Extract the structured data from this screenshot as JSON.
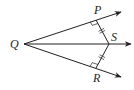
{
  "diagram": {
    "type": "geometry",
    "stroke_color": "#231f20",
    "points": {
      "Q": {
        "label": "Q",
        "x": 24,
        "y": 44
      },
      "P": {
        "label": "P",
        "x": 96,
        "y": 20
      },
      "S": {
        "label": "S",
        "x": 109,
        "y": 44
      },
      "R": {
        "label": "R",
        "x": 96,
        "y": 68
      }
    },
    "rays": [
      {
        "name": "ray-QP",
        "from": "Q",
        "through": "P",
        "end": {
          "x": 121,
          "y": 12
        }
      },
      {
        "name": "ray-QS",
        "from": "Q",
        "through": "S",
        "end": {
          "x": 131,
          "y": 44
        }
      },
      {
        "name": "ray-QR",
        "from": "Q",
        "through": "R",
        "end": {
          "x": 121,
          "y": 77
        }
      }
    ],
    "segments": [
      {
        "name": "segment-PS",
        "from": "P",
        "to": "S"
      },
      {
        "name": "segment-RS",
        "from": "R",
        "to": "S"
      }
    ],
    "marks": {
      "right_angles": [
        "P",
        "R"
      ],
      "congruent_ticks": [
        "segment-PS",
        "segment-RS"
      ]
    }
  }
}
